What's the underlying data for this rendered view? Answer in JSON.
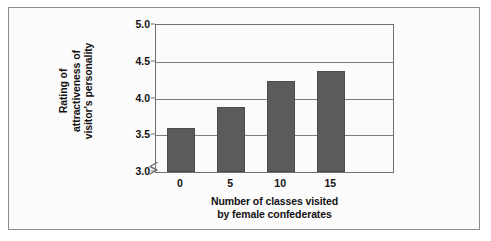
{
  "chart_data": {
    "type": "bar",
    "title": "",
    "subtitle": "",
    "xlabel_lines": [
      "Number of classes visited",
      "by female confederates"
    ],
    "xlabel": "Number of classes visited by female confederates",
    "ylabel_lines": [
      "Rating of",
      "attractiveness of",
      "visitor's personality"
    ],
    "ylabel": "Rating of attractiveness of visitor's personality",
    "categories": [
      "0",
      "5",
      "10",
      "15"
    ],
    "values": [
      3.6,
      3.88,
      4.24,
      4.37
    ],
    "ytick_labels": [
      "3.0",
      "3.5",
      "4.0",
      "4.5",
      "5.0"
    ],
    "ytick_values": [
      3.0,
      3.5,
      4.0,
      4.5,
      5.0
    ],
    "ylim": [
      3.0,
      5.0
    ],
    "y_axis_break": true,
    "grid": true,
    "legend": "none",
    "bar_color": "#5b5b5b",
    "bar_edge_color": "#4c4c4c",
    "gridline_color": "#7d7d7d",
    "axis_color": "#6f6f6f",
    "plot_background": "#fbfbfb",
    "frame_border_color": "#8e8e8e",
    "text_color": "#121212"
  }
}
